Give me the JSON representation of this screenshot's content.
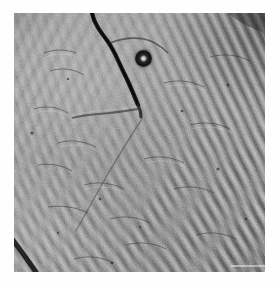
{
  "figure": {
    "kind": "grayscale-micrograph",
    "modality_hint": "differential-interference-contrast",
    "caption": "",
    "frame": {
      "background_color": "#fefefe",
      "image_left": 14,
      "image_top": 13,
      "image_width": 251,
      "image_height": 259
    },
    "palette": {
      "background": "#fefefe",
      "mid_tone": "#8b8b8b",
      "highlight": "#c8c8c8",
      "shadow": "#1e1e1e",
      "darkest": "#0d0d0d"
    },
    "texture": {
      "striation_period_px": 8,
      "striation_families": [
        {
          "name": "right-upper-right",
          "angle_deg": 65,
          "period_px": 8,
          "contrast": "high"
        },
        {
          "name": "bottom-lower-right",
          "angle_deg": 52,
          "period_px": 8,
          "contrast": "medium"
        },
        {
          "name": "left-lower-left",
          "angle_deg": 72,
          "period_px": 8,
          "contrast": "low"
        },
        {
          "name": "top-left-oblique",
          "angle_deg": 118,
          "period_px": 12,
          "contrast": "very-low"
        }
      ]
    },
    "features": [
      {
        "name": "bead",
        "label": "dark ring particle with bright core",
        "cx": 143,
        "cy": 58,
        "diameter_px": 17
      },
      {
        "name": "primary-fissure",
        "label": "dark crack from top edge to centre",
        "from": "96,14",
        "to": "136,104"
      },
      {
        "name": "lateral-fissure",
        "label": "near-horizontal dark line left of centre",
        "from": "135,108",
        "to": "74,116"
      },
      {
        "name": "corner-streak",
        "label": "dark streak in lower-left corner",
        "from": "14,244",
        "to": "36,272"
      },
      {
        "name": "scale-bar",
        "label": "faint horizontal scale marker",
        "x": 231,
        "y": 265,
        "length_px": 34
      }
    ]
  }
}
